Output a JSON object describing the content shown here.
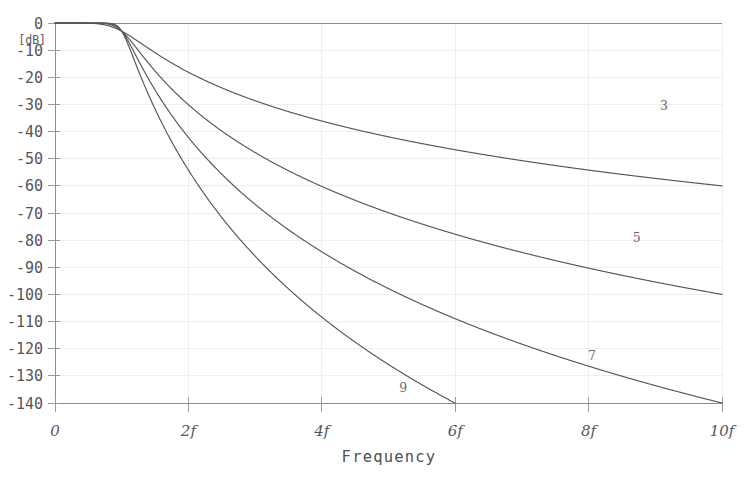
{
  "chart_data": {
    "type": "line",
    "title": "",
    "xlabel": "Frequency",
    "ylabel": "[dB]",
    "xlim": [
      0,
      10
    ],
    "ylim": [
      -140,
      0
    ],
    "grid": true,
    "legend_position": "inline-right",
    "x_tick_values": [
      0,
      2,
      4,
      6,
      8,
      10
    ],
    "x_tick_labels": [
      "0",
      "2f",
      "4f",
      "6f",
      "8f",
      "10f"
    ],
    "y_tick_values": [
      0,
      -10,
      -20,
      -30,
      -40,
      -50,
      -60,
      -70,
      -80,
      -90,
      -100,
      -110,
      -120,
      -130,
      -140
    ],
    "y_tick_labels": [
      "0",
      "-10",
      "-20",
      "-30",
      "-40",
      "-50",
      "-60",
      "-70",
      "-80",
      "-90",
      "-100",
      "-110",
      "-120",
      "-130",
      "-140"
    ],
    "cutoff_frequency": 1,
    "series": [
      {
        "name": "3",
        "order": 3,
        "label": "3",
        "label_x": 9.13,
        "label_y": -32.0,
        "rolloff_db_per_decade": 60,
        "x": [
          0,
          0.5,
          1.0,
          1.2,
          1.5,
          2.0,
          2.5,
          3.0,
          3.5,
          4.0,
          4.5,
          5.0,
          5.5,
          6.0,
          6.5,
          7.0,
          7.5,
          8.0,
          8.5,
          9.0,
          9.5,
          10.0
        ],
        "values": [
          0,
          0,
          -0.1,
          -0.4,
          -1.6,
          -6.2,
          -11.7,
          -16.6,
          -20.8,
          -24.4,
          -27.6,
          -30.4,
          -32.9,
          -35.2,
          -37.3,
          -39.2,
          -41.0,
          -42.7,
          -44.3,
          -45.7,
          -47.1,
          -48.4
        ]
      },
      {
        "name": "5",
        "order": 5,
        "label": "5",
        "label_x": 8.72,
        "label_y": -80.5,
        "rolloff_db_per_decade": 100,
        "x": [
          0,
          0.5,
          1.0,
          1.2,
          1.5,
          2.0,
          2.5,
          3.0,
          3.5,
          4.0,
          4.5,
          5.0,
          5.5,
          6.0,
          6.5,
          7.0,
          7.5,
          8.0,
          8.5,
          9.0,
          9.5,
          10.0
        ],
        "values": [
          0,
          0,
          -0.1,
          -0.7,
          -2.6,
          -10.3,
          -19.5,
          -27.7,
          -34.7,
          -40.6,
          -45.9,
          -50.6,
          -54.8,
          -58.6,
          -62.1,
          -65.4,
          -68.4,
          -71.2,
          -73.8,
          -76.2,
          -78.5,
          -80.7
        ]
      },
      {
        "name": "7",
        "order": 7,
        "label": "7",
        "label_x": 8.05,
        "label_y": -124.0,
        "rolloff_db_per_decade": 140,
        "x": [
          0,
          0.5,
          1.0,
          1.2,
          1.5,
          2.0,
          2.5,
          3.0,
          3.5,
          4.0,
          4.5,
          5.0,
          5.5,
          6.0,
          6.5,
          7.0,
          7.5,
          8.0,
          8.5,
          9.0,
          9.5,
          10.0
        ],
        "values": [
          0,
          0,
          -0.1,
          -1.0,
          -3.6,
          -14.4,
          -27.3,
          -38.8,
          -48.6,
          -56.8,
          -64.2,
          -70.8,
          -76.7,
          -82.0,
          -86.9,
          -91.5,
          -95.8,
          -99.8,
          -103.3,
          -106.7,
          -109.9,
          -113.0
        ]
      },
      {
        "name": "9",
        "order": 9,
        "label": "9",
        "label_x": 5.22,
        "label_y": -136.0,
        "rolloff_db_per_decade": 180,
        "x": [
          0,
          0.5,
          1.0,
          1.2,
          1.5,
          2.0,
          2.5,
          3.0,
          3.5,
          4.0,
          4.5,
          5.0,
          5.2
        ],
        "values": [
          0,
          0,
          -0.1,
          -1.3,
          -4.7,
          -18.5,
          -35.1,
          -49.9,
          -62.5,
          -73.1,
          -82.5,
          -91.0,
          -94.3
        ]
      }
    ]
  },
  "caption": {
    "top_faint_text": ""
  }
}
